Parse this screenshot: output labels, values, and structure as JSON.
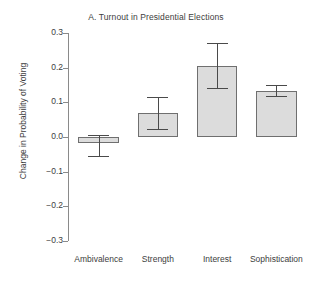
{
  "chart_data": {
    "type": "bar",
    "title": "A. Turnout in Presidential Elections",
    "xlabel": "",
    "ylabel": "Change in Probability of Voting",
    "categories": [
      "Ambivalence",
      "Strength",
      "Interest",
      "Sophistication"
    ],
    "values": [
      -0.016,
      0.068,
      0.205,
      0.133
    ],
    "error_low": [
      -0.055,
      0.022,
      0.141,
      0.117
    ],
    "error_high": [
      0.005,
      0.116,
      0.272,
      0.151
    ],
    "ylim": [
      -0.3,
      0.3
    ],
    "yticks": [
      0.3,
      0.2,
      0.1,
      0.0,
      -0.1,
      -0.2,
      -0.3
    ],
    "ytick_labels": [
      "0.3",
      "0.2",
      "0.1",
      "0.0",
      "−0.1",
      "−0.2",
      "−0.3"
    ],
    "grid": false,
    "legend": "none",
    "bar_color": "#dcdcdc",
    "bar_border_color": "#6f6f6f",
    "error_color": "#4a4a4a",
    "axis_color": "#8a8a8a"
  }
}
